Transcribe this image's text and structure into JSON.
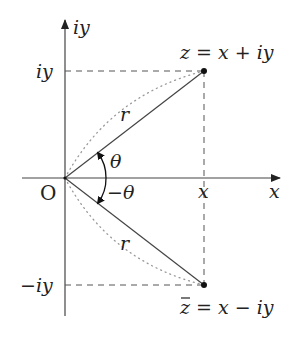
{
  "diagram": {
    "type": "complex-plane",
    "axes": {
      "x_label": "x",
      "y_label": "iy",
      "origin_label": "O"
    },
    "ticks": {
      "x_tick": "x",
      "y_tick_pos": "iy",
      "y_tick_neg": "−iy"
    },
    "points": [
      {
        "id": "z",
        "label": "z = x + iy",
        "x": "x",
        "y": "iy"
      },
      {
        "id": "zbar",
        "label": "z̄ = x − iy",
        "x": "x",
        "y": "−iy",
        "conjugate": true
      }
    ],
    "vectors": [
      {
        "from": "O",
        "to": "z",
        "length_label": "r",
        "angle_label": "θ"
      },
      {
        "from": "O",
        "to": "zbar",
        "length_label": "r",
        "angle_label": "−θ"
      }
    ],
    "labels": {
      "z_text": "z = x + iy",
      "zbar_text": "z = x − iy",
      "r_upper": "r",
      "r_lower": "r",
      "theta": "θ",
      "neg_theta": "−θ",
      "x_axis": "x",
      "x_tick": "x",
      "y_axis": "iy",
      "y_tick_pos": "iy",
      "y_tick_neg": "−iy",
      "origin": "O"
    },
    "colors": {
      "line": "#444444",
      "dotted": "#999999",
      "text": "#222222"
    }
  }
}
